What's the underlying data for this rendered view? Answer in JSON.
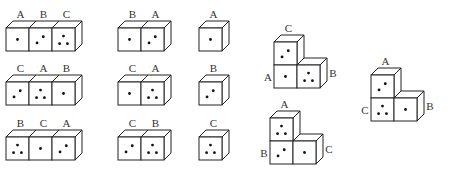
{
  "colors": {
    "line": "#222222",
    "background": "#ffffff",
    "dot": "#111111"
  },
  "rows": [
    {
      "strips": [
        {
          "labels": [
            "A",
            "B",
            "C"
          ],
          "faces": [
            1,
            2,
            3
          ]
        },
        {
          "labels": [
            "B",
            "A"
          ],
          "faces": [
            1,
            2
          ]
        },
        {
          "labels": [
            "A"
          ],
          "faces": [
            1
          ]
        }
      ]
    },
    {
      "strips": [
        {
          "labels": [
            "C",
            "A",
            "B"
          ],
          "faces": [
            2,
            3,
            1
          ]
        },
        {
          "labels": [
            "C",
            "A"
          ],
          "faces": [
            1,
            3
          ]
        },
        {
          "labels": [
            "B"
          ],
          "faces": [
            2
          ]
        }
      ]
    },
    {
      "strips": [
        {
          "labels": [
            "B",
            "C",
            "A"
          ],
          "faces": [
            3,
            1,
            2
          ]
        },
        {
          "labels": [
            "C",
            "B"
          ],
          "faces": [
            2,
            3
          ]
        },
        {
          "labels": [
            "C"
          ],
          "faces": [
            3
          ]
        }
      ]
    }
  ],
  "l_shapes": [
    {
      "top_label": "C",
      "left_label": "A",
      "right_label": "B",
      "top_face": 2,
      "bottom_left_face": 1,
      "bottom_right_face": 3
    },
    {
      "top_label": "A",
      "left_label": "B",
      "right_label": "C",
      "top_face": 3,
      "bottom_left_face": 2,
      "bottom_right_face": 1
    },
    {
      "top_label": "A",
      "left_label": "C",
      "right_label": "B",
      "top_face": 2,
      "bottom_left_face": 3,
      "bottom_right_face": 1
    }
  ]
}
